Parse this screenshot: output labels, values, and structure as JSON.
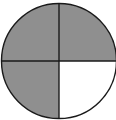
{
  "diagram": {
    "type": "fraction-circle",
    "parts_total": 4,
    "parts_shaded": 3,
    "fraction_shaded": "3/4",
    "shaded_quadrants": [
      "top-left",
      "top-right",
      "bottom-left"
    ],
    "unshaded_quadrants": [
      "bottom-right"
    ],
    "colors": {
      "shaded": "#8f8f8f",
      "unshaded": "#ffffff",
      "stroke": "#1a1a1a"
    }
  }
}
